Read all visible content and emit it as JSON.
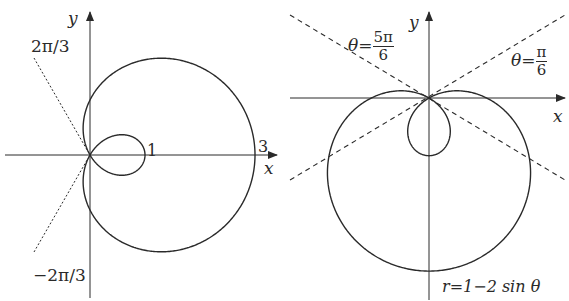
{
  "top_text_partial": "",
  "left_plot": {
    "name": "cardioid-with-inner-loop",
    "equation": "r = 1 + 2cos θ",
    "axis_x_label": "x",
    "axis_y_label": "y",
    "angle_label_upper": "2π/3",
    "angle_label_lower": "−2π/3",
    "tick_inner": "1",
    "tick_outer": "3",
    "origin_px": [
      90,
      155
    ],
    "scale_px": 55,
    "line_style_tangents": "dotted"
  },
  "right_plot": {
    "name": "limacon-with-inner-loop",
    "axis_x_label": "x",
    "axis_y_label": "y",
    "theta_label": "θ",
    "eq_sign": "=",
    "tangent_left": {
      "num": "5π",
      "den": "6"
    },
    "tangent_right": {
      "num": "π",
      "den": "6"
    },
    "equation_label": "r=1−2 sin θ",
    "origin_px": [
      429,
      98
    ],
    "scale_px": 57.7,
    "line_style_tangents": "dashed"
  },
  "colors": {
    "stroke": "#2a2a2a",
    "background": "#ffffff"
  }
}
